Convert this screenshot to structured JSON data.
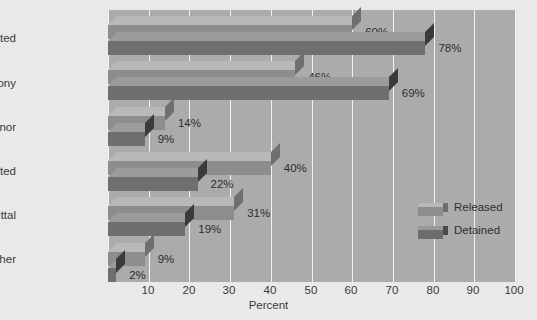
{
  "chart_data": {
    "type": "bar",
    "orientation": "horizontal",
    "title": "",
    "xlabel": "Percent",
    "ylabel": "",
    "xlim": [
      0,
      100
    ],
    "xticks": [
      0,
      10,
      20,
      30,
      40,
      50,
      60,
      70,
      80,
      90,
      100
    ],
    "xtick_labels": [
      "",
      "10",
      "20",
      "30",
      "40",
      "50",
      "60",
      "70",
      "80",
      "90",
      "100"
    ],
    "grid": true,
    "legend_position": "inside-right",
    "value_suffix": "%",
    "categories": [
      "Convicted",
      "Felony",
      "Misdemeanor",
      "Not convicted",
      "Dismissal/acquittal",
      "Other"
    ],
    "series": [
      {
        "name": "Released",
        "color": "#8d8d8d",
        "values": [
          60,
          46,
          14,
          40,
          31,
          9
        ],
        "value_labels": [
          "60%",
          "46%",
          "14%",
          "40%",
          "31%",
          "9%"
        ]
      },
      {
        "name": "Detained",
        "color": "#6d6d6d",
        "values": [
          78,
          69,
          9,
          22,
          19,
          2
        ],
        "value_labels": [
          "78%",
          "69%",
          "9%",
          "22%",
          "19%",
          "2%"
        ]
      }
    ]
  },
  "colors": {
    "page_background": "#e9e9e9",
    "plot_background": "#ababab",
    "gridline": "#f2f2f2",
    "released": "#8d8d8d",
    "detained": "#6d6d6d",
    "text": "#2b2b2b"
  },
  "legend": {
    "items": [
      {
        "label": "Released",
        "swatch": "released-swatch-icon"
      },
      {
        "label": "Detained",
        "swatch": "detained-swatch-icon"
      }
    ]
  },
  "axis": {
    "x_title": "Percent"
  }
}
